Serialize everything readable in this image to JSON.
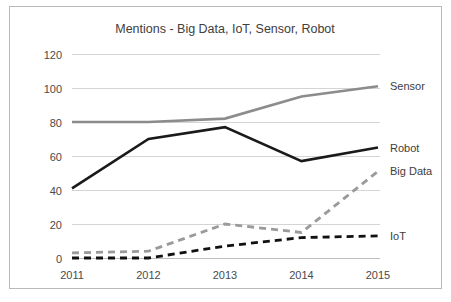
{
  "chart_data": {
    "type": "line",
    "title": "Mentions - Big Data, IoT, Sensor, Robot",
    "xlabel": "",
    "ylabel": "",
    "categories": [
      "2011",
      "2012",
      "2013",
      "2014",
      "2015"
    ],
    "x": [
      2011,
      2012,
      2013,
      2014,
      2015
    ],
    "ylim": [
      0,
      120
    ],
    "yticks": [
      0,
      20,
      40,
      60,
      80,
      100,
      120
    ],
    "ytick_labels": [
      "0",
      "20",
      "40",
      "60",
      "80",
      "100",
      "120"
    ],
    "grid": "horizontal",
    "legend_position": "right-of-plot-line-end",
    "series": [
      {
        "name": "Sensor",
        "values": [
          80,
          80,
          82,
          95,
          101
        ],
        "color": "#8c8c8c",
        "style": "solid",
        "width": 2.6,
        "label": "Sensor"
      },
      {
        "name": "Robot",
        "values": [
          41,
          70,
          77,
          57,
          65
        ],
        "color": "#1a1a1a",
        "style": "solid",
        "width": 2.6,
        "label": "Robot"
      },
      {
        "name": "Big Data",
        "values": [
          3,
          4,
          20,
          15,
          51
        ],
        "color": "#9a9a9a",
        "style": "dashed",
        "width": 2.8,
        "label": "Big Data"
      },
      {
        "name": "IoT",
        "values": [
          0,
          0,
          7,
          12,
          13
        ],
        "color": "#111111",
        "style": "dashed",
        "width": 2.8,
        "label": "IoT"
      }
    ]
  },
  "frame": {
    "border_color": "#b9b9b9",
    "background": "#ffffff"
  }
}
